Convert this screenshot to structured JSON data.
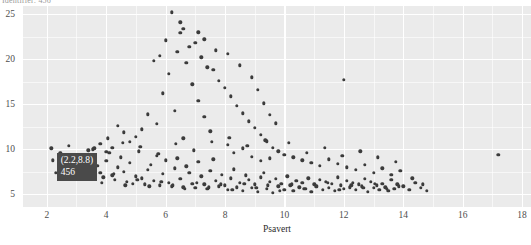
{
  "title": "Identifier: 456",
  "axes": {
    "x_label": "Psavert",
    "y_label": "",
    "x_ticks": [
      "2",
      "4",
      "6",
      "8",
      "10",
      "12",
      "14",
      "16",
      "18"
    ],
    "y_ticks": [
      "5",
      "10",
      "15",
      "20",
      "25"
    ]
  },
  "tooltip": {
    "coords": "(2.2,8.8)",
    "id": "456",
    "x": 2.2,
    "y": 8.8,
    "bg_color": "#4a4a4a",
    "text_color": "#ffffff"
  },
  "colors": {
    "panel": "#ebebeb",
    "grid": "#ffffff",
    "point": "#3b3b3b",
    "axis_text": "#4d4d4d",
    "page_bg": "#ffffff"
  },
  "chart_data": {
    "type": "scatter",
    "title": "",
    "xlabel": "Psavert",
    "ylabel": "",
    "xlim": [
      1.2,
      18.3
    ],
    "ylim": [
      3.6,
      25.9
    ],
    "grid": true,
    "legend": "none",
    "x_ticks": [
      2,
      4,
      6,
      8,
      10,
      12,
      14,
      16,
      18
    ],
    "y_ticks": [
      5,
      10,
      15,
      20,
      25
    ],
    "x_minor_ticks": [
      3,
      5,
      7,
      9,
      11,
      13,
      15,
      17
    ],
    "y_minor_ticks": [
      7.5,
      12.5,
      17.5,
      22.5
    ],
    "annotations": [
      {
        "label": "(2.2,8.8) 456",
        "x": 2.2,
        "y": 8.8,
        "type": "tooltip"
      }
    ],
    "points": [
      [
        2.2,
        8.8
      ],
      [
        2.4,
        8.3
      ],
      [
        2.5,
        7.9
      ],
      [
        2.6,
        9.2
      ],
      [
        2.8,
        8.6
      ],
      [
        2.9,
        7.6
      ],
      [
        3.0,
        8.1
      ],
      [
        3.1,
        9.0
      ],
      [
        3.2,
        8.4
      ],
      [
        3.3,
        7.2
      ],
      [
        3.4,
        8.9
      ],
      [
        3.5,
        7.8
      ],
      [
        3.6,
        9.4
      ],
      [
        3.7,
        8.2
      ],
      [
        3.8,
        7.4
      ],
      [
        3.9,
        6.9
      ],
      [
        4.0,
        8.7
      ],
      [
        4.1,
        9.6
      ],
      [
        4.2,
        7.1
      ],
      [
        4.3,
        6.6
      ],
      [
        4.4,
        8.0
      ],
      [
        4.5,
        9.1
      ],
      [
        4.6,
        7.5
      ],
      [
        4.7,
        6.4
      ],
      [
        4.8,
        8.5
      ],
      [
        4.9,
        6.2
      ],
      [
        5.0,
        7.0
      ],
      [
        5.1,
        9.8
      ],
      [
        5.2,
        6.8
      ],
      [
        5.3,
        6.1
      ],
      [
        5.4,
        7.7
      ],
      [
        5.5,
        8.3
      ],
      [
        5.6,
        6.5
      ],
      [
        5.7,
        9.3
      ],
      [
        5.8,
        6.0
      ],
      [
        5.9,
        7.3
      ],
      [
        6.0,
        8.8
      ],
      [
        6.1,
        6.3
      ],
      [
        6.2,
        5.9
      ],
      [
        6.3,
        7.9
      ],
      [
        6.4,
        9.0
      ],
      [
        6.5,
        6.7
      ],
      [
        6.6,
        5.8
      ],
      [
        6.7,
        8.1
      ],
      [
        6.8,
        7.4
      ],
      [
        6.9,
        6.2
      ],
      [
        7.0,
        5.7
      ],
      [
        7.1,
        8.6
      ],
      [
        7.2,
        7.0
      ],
      [
        7.3,
        6.1
      ],
      [
        7.4,
        5.6
      ],
      [
        7.5,
        7.6
      ],
      [
        7.6,
        8.9
      ],
      [
        7.7,
        6.5
      ],
      [
        7.8,
        5.9
      ],
      [
        7.9,
        7.2
      ],
      [
        8.0,
        6.0
      ],
      [
        8.1,
        5.5
      ],
      [
        8.2,
        6.8
      ],
      [
        8.3,
        7.8
      ],
      [
        8.4,
        5.8
      ],
      [
        8.5,
        6.3
      ],
      [
        8.6,
        5.4
      ],
      [
        8.7,
        7.1
      ],
      [
        8.8,
        6.6
      ],
      [
        8.9,
        5.7
      ],
      [
        9.0,
        6.1
      ],
      [
        9.1,
        5.3
      ],
      [
        9.2,
        6.9
      ],
      [
        9.3,
        7.4
      ],
      [
        9.4,
        5.6
      ],
      [
        9.5,
        6.4
      ],
      [
        9.6,
        5.2
      ],
      [
        9.7,
        6.7
      ],
      [
        9.8,
        5.9
      ],
      [
        9.9,
        6.2
      ],
      [
        10.0,
        5.5
      ],
      [
        10.1,
        7.0
      ],
      [
        10.2,
        6.0
      ],
      [
        10.3,
        5.4
      ],
      [
        10.4,
        6.5
      ],
      [
        10.5,
        5.8
      ],
      [
        10.6,
        6.3
      ],
      [
        10.7,
        5.6
      ],
      [
        10.8,
        6.8
      ],
      [
        10.9,
        5.3
      ],
      [
        11.0,
        6.1
      ],
      [
        11.1,
        5.9
      ],
      [
        11.2,
        6.6
      ],
      [
        11.3,
        5.5
      ],
      [
        11.4,
        6.4
      ],
      [
        11.5,
        5.7
      ],
      [
        11.6,
        6.2
      ],
      [
        11.7,
        5.4
      ],
      [
        11.8,
        6.9
      ],
      [
        11.9,
        6.0
      ],
      [
        12.0,
        5.6
      ],
      [
        12.1,
        6.5
      ],
      [
        12.2,
        5.8
      ],
      [
        12.3,
        6.3
      ],
      [
        12.4,
        5.5
      ],
      [
        12.5,
        6.1
      ],
      [
        12.6,
        5.9
      ],
      [
        12.7,
        6.7
      ],
      [
        12.8,
        5.3
      ],
      [
        12.9,
        6.4
      ],
      [
        13.0,
        5.7
      ],
      [
        13.1,
        6.0
      ],
      [
        13.2,
        5.5
      ],
      [
        13.3,
        6.2
      ],
      [
        13.4,
        5.8
      ],
      [
        13.5,
        5.4
      ],
      [
        13.6,
        6.6
      ],
      [
        13.7,
        5.6
      ],
      [
        13.8,
        6.1
      ],
      [
        14.0,
        5.9
      ],
      [
        14.2,
        5.5
      ],
      [
        14.4,
        6.3
      ],
      [
        14.6,
        5.7
      ],
      [
        14.8,
        5.4
      ],
      [
        6.2,
        25.2
      ],
      [
        6.5,
        22.9
      ],
      [
        6.8,
        21.4
      ],
      [
        6.4,
        20.8
      ],
      [
        7.0,
        21.8
      ],
      [
        7.2,
        20.2
      ],
      [
        6.7,
        19.6
      ],
      [
        7.4,
        19.1
      ],
      [
        6.1,
        18.4
      ],
      [
        7.6,
        18.8
      ],
      [
        7.8,
        17.6
      ],
      [
        6.9,
        17.2
      ],
      [
        8.0,
        16.8
      ],
      [
        5.9,
        16.2
      ],
      [
        8.2,
        15.9
      ],
      [
        7.1,
        15.4
      ],
      [
        8.4,
        14.8
      ],
      [
        6.3,
        14.3
      ],
      [
        8.6,
        14.0
      ],
      [
        7.3,
        13.6
      ],
      [
        8.8,
        13.1
      ],
      [
        5.7,
        12.8
      ],
      [
        9.0,
        12.4
      ],
      [
        7.5,
        12.0
      ],
      [
        9.2,
        11.6
      ],
      [
        6.6,
        11.2
      ],
      [
        9.4,
        10.9
      ],
      [
        8.1,
        10.5
      ],
      [
        9.6,
        10.2
      ],
      [
        5.4,
        13.9
      ],
      [
        5.2,
        12.2
      ],
      [
        5.0,
        11.4
      ],
      [
        4.8,
        10.8
      ],
      [
        4.6,
        11.9
      ],
      [
        4.4,
        12.6
      ],
      [
        9.8,
        9.8
      ],
      [
        10.0,
        9.4
      ],
      [
        10.3,
        9.1
      ],
      [
        10.6,
        8.8
      ],
      [
        10.9,
        8.5
      ],
      [
        11.2,
        8.2
      ],
      [
        11.5,
        8.9
      ],
      [
        11.8,
        8.4
      ],
      [
        12.1,
        8.0
      ],
      [
        12.4,
        7.7
      ],
      [
        12.7,
        8.3
      ],
      [
        13.0,
        7.4
      ],
      [
        13.3,
        7.9
      ],
      [
        13.6,
        7.2
      ],
      [
        13.9,
        7.6
      ],
      [
        8.3,
        9.6
      ],
      [
        8.6,
        10.1
      ],
      [
        8.9,
        9.2
      ],
      [
        9.2,
        8.7
      ],
      [
        9.5,
        9.0
      ],
      [
        4.2,
        10.2
      ],
      [
        4.0,
        9.7
      ],
      [
        3.8,
        10.6
      ],
      [
        3.6,
        10.1
      ],
      [
        3.4,
        9.9
      ],
      [
        5.6,
        19.8
      ],
      [
        5.8,
        20.4
      ],
      [
        6.0,
        22.1
      ],
      [
        6.6,
        23.4
      ],
      [
        7.1,
        23.0
      ],
      [
        7.3,
        22.2
      ],
      [
        7.7,
        21.0
      ],
      [
        8.1,
        20.6
      ],
      [
        8.5,
        19.3
      ],
      [
        8.9,
        18.0
      ],
      [
        9.1,
        16.6
      ],
      [
        9.3,
        15.1
      ],
      [
        9.5,
        13.8
      ],
      [
        9.7,
        12.9
      ],
      [
        6.5,
        24.1
      ],
      [
        12.0,
        17.7
      ],
      [
        17.2,
        9.4
      ],
      [
        2.3,
        7.4
      ],
      [
        2.7,
        6.9
      ],
      [
        3.05,
        7.6
      ],
      [
        3.45,
        6.7
      ],
      [
        3.85,
        6.3
      ],
      [
        4.25,
        7.3
      ],
      [
        4.65,
        6.0
      ],
      [
        5.05,
        6.6
      ],
      [
        5.45,
        5.9
      ],
      [
        5.85,
        6.4
      ],
      [
        6.25,
        6.0
      ],
      [
        6.65,
        5.6
      ],
      [
        7.05,
        6.3
      ],
      [
        7.45,
        5.8
      ],
      [
        7.85,
        6.1
      ],
      [
        8.25,
        5.5
      ],
      [
        8.65,
        6.2
      ],
      [
        9.05,
        5.7
      ],
      [
        9.45,
        6.0
      ],
      [
        9.85,
        5.4
      ],
      [
        10.25,
        6.1
      ],
      [
        10.65,
        5.6
      ],
      [
        11.05,
        5.9
      ],
      [
        11.45,
        6.3
      ],
      [
        11.85,
        5.5
      ],
      [
        12.25,
        6.0
      ],
      [
        12.65,
        5.7
      ],
      [
        13.05,
        6.2
      ],
      [
        13.45,
        5.6
      ],
      [
        13.85,
        5.9
      ],
      [
        2.15,
        10.1
      ],
      [
        2.45,
        9.6
      ],
      [
        2.75,
        10.4
      ],
      [
        3.15,
        9.3
      ],
      [
        3.55,
        10.0
      ],
      [
        4.05,
        11.2
      ],
      [
        4.55,
        10.7
      ],
      [
        5.15,
        10.3
      ],
      [
        5.75,
        9.5
      ],
      [
        6.35,
        10.6
      ],
      [
        6.95,
        9.9
      ],
      [
        7.55,
        10.8
      ],
      [
        8.15,
        11.3
      ],
      [
        8.75,
        10.4
      ],
      [
        9.35,
        11.0
      ],
      [
        10.15,
        10.7
      ],
      [
        10.75,
        9.6
      ],
      [
        11.35,
        10.2
      ],
      [
        11.95,
        9.3
      ],
      [
        12.55,
        9.8
      ],
      [
        13.15,
        9.1
      ],
      [
        13.75,
        8.6
      ],
      [
        14.3,
        6.8
      ],
      [
        14.65,
        6.1
      ]
    ]
  }
}
